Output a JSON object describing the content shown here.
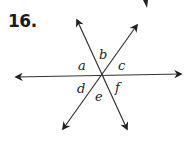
{
  "problem": {
    "number": "16.",
    "description": "Three lines intersecting at a single point forming six angles",
    "angle_labels": [
      "a",
      "b",
      "c",
      "d",
      "e",
      "f"
    ],
    "line_color": "#333333"
  }
}
